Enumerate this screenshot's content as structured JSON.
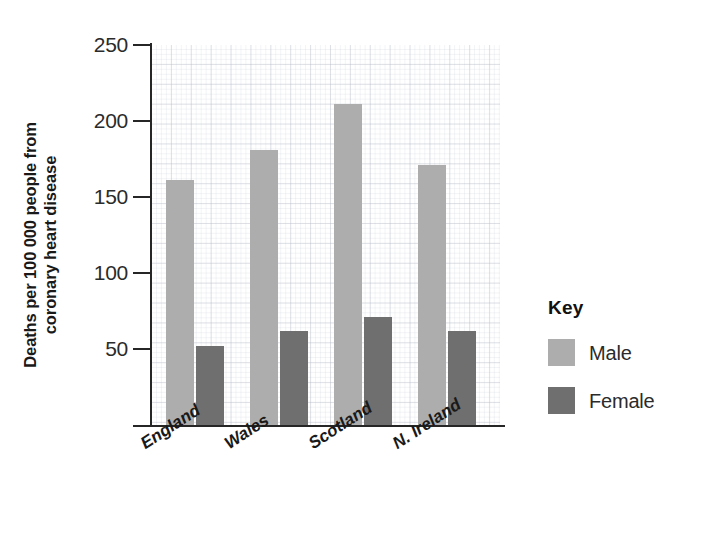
{
  "chart_data": {
    "type": "bar",
    "title": "",
    "subtitle": "",
    "xlabel": "",
    "ylabel_lines": [
      "Deaths per 100 000 people from",
      "coronary heart disease"
    ],
    "ylabel": "Deaths per 100 000 people from coronary heart disease",
    "categories": [
      "England",
      "Wales",
      "Scotland",
      "N. Ireland"
    ],
    "series": [
      {
        "name": "Male",
        "values": [
          161,
          181,
          211,
          171
        ],
        "color": "#adadad"
      },
      {
        "name": "Female",
        "values": [
          52,
          62,
          71,
          62
        ],
        "color": "#6f6f6f"
      }
    ],
    "ylim": [
      0,
      250
    ],
    "ytick_labels": [
      "250",
      "200",
      "150",
      "100",
      "50"
    ],
    "ytick_values": [
      250,
      200,
      150,
      100,
      50
    ],
    "grid": true,
    "grid_style": "graph-paper",
    "legend_position": "right",
    "legend_title": "Key"
  },
  "legend": {
    "title": "Key",
    "entries": [
      {
        "label": "Male",
        "color": "#adadad"
      },
      {
        "label": "Female",
        "color": "#6f6f6f"
      }
    ]
  },
  "axes": {
    "y_title_line1": "Deaths per 100 000 people from",
    "y_title_line2": "coronary heart disease",
    "y_ticks": [
      {
        "label": "250",
        "value": 250
      },
      {
        "label": "200",
        "value": 200
      },
      {
        "label": "150",
        "value": 150
      },
      {
        "label": "100",
        "value": 100
      },
      {
        "label": "50",
        "value": 50
      }
    ],
    "x_categories": [
      {
        "label": "England"
      },
      {
        "label": "Wales"
      },
      {
        "label": "Scotland"
      },
      {
        "label": "N. Ireland"
      }
    ]
  }
}
